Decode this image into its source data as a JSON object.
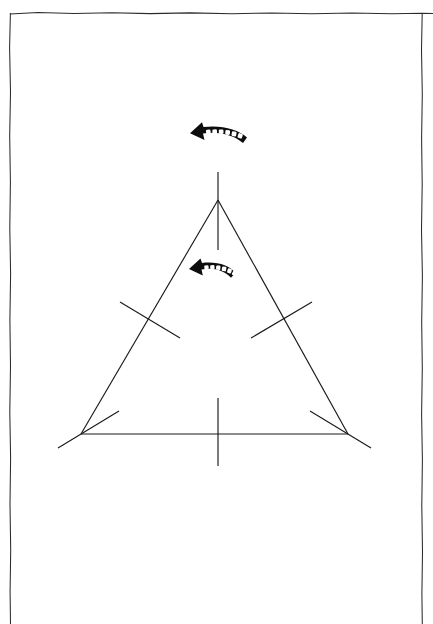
{
  "document": {
    "title": "Geometric construction diagram",
    "background_color": "#ffffff",
    "ink_color": "#1a1a1a",
    "page_width": 433,
    "page_height": 624
  },
  "page_border": {
    "name": "page-border-rule",
    "style": "hand-drawn rough rectangle, open at bottom",
    "color": "#2b2b2b",
    "left": 10,
    "top": 13,
    "right": 422
  },
  "figure": {
    "type": "line-drawing",
    "caption": "",
    "shapes": {
      "triangle": {
        "label": "equilateral-triangle",
        "vertices": [
          {
            "name": "apex",
            "x": 218,
            "y": 200
          },
          {
            "name": "bottom-left",
            "x": 81,
            "y": 434
          },
          {
            "name": "bottom-right",
            "x": 348,
            "y": 434
          }
        ]
      },
      "construction_lines": [
        {
          "name": "apex-vertical-bisector",
          "x1": 218,
          "y1": 172,
          "x2": 218,
          "y2": 250
        },
        {
          "name": "base-vertical-bisector",
          "x1": 218,
          "y1": 398,
          "x2": 218,
          "y2": 466
        },
        {
          "name": "left-side-cross-tick",
          "x1": 120,
          "y1": 302,
          "x2": 180,
          "y2": 338
        },
        {
          "name": "right-side-cross-tick",
          "x1": 251,
          "y1": 338,
          "x2": 312,
          "y2": 302
        },
        {
          "name": "bottom-left-angle-bisector",
          "x1": 58,
          "y1": 448,
          "x2": 119,
          "y2": 411
        },
        {
          "name": "bottom-right-angle-bisector",
          "x1": 310,
          "y1": 411,
          "x2": 371,
          "y2": 448
        }
      ],
      "arrows": [
        {
          "name": "upper-curved-arrow",
          "direction": "left",
          "style": "curved-dashed-block-arrow",
          "color": "#0d0d0d",
          "x": 190,
          "y": 126,
          "width": 57,
          "height": 24,
          "notches": 6
        },
        {
          "name": "lower-curved-arrow",
          "direction": "left",
          "style": "curved-dashed-block-arrow",
          "color": "#0d0d0d",
          "x": 189,
          "y": 261,
          "width": 48,
          "height": 24,
          "notches": 6
        }
      ]
    }
  }
}
